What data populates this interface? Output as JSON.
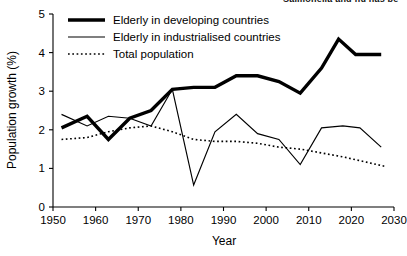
{
  "clipped_header": "Salmonella and flu has be",
  "chart_data": {
    "type": "line",
    "title": "",
    "xlabel": "Year",
    "ylabel": "Population growth (%)",
    "xlim": [
      1950,
      2030
    ],
    "ylim": [
      0,
      5
    ],
    "xticks": [
      1950,
      1960,
      1970,
      1980,
      1990,
      2000,
      2010,
      2020,
      2030
    ],
    "yticks": [
      0,
      1,
      2,
      3,
      4,
      5
    ],
    "grid": false,
    "legend_position": "top-left",
    "series": [
      {
        "name": "Elderly in developing countries",
        "style": "thick-solid",
        "color": "#000000",
        "x": [
          1952,
          1958,
          1963,
          1968,
          1973,
          1978,
          1983,
          1988,
          1993,
          1998,
          2003,
          2008,
          2013,
          2017,
          2021,
          2027
        ],
        "values": [
          2.05,
          2.35,
          1.75,
          2.3,
          2.5,
          3.05,
          3.1,
          3.1,
          3.4,
          3.4,
          3.25,
          2.95,
          3.6,
          4.35,
          3.95,
          3.95
        ]
      },
      {
        "name": "Elderly in industrialised countries",
        "style": "thin-solid",
        "color": "#000000",
        "x": [
          1952,
          1958,
          1963,
          1968,
          1973,
          1978,
          1983,
          1988,
          1993,
          1998,
          2003,
          2008,
          2013,
          2018,
          2022,
          2027
        ],
        "values": [
          2.4,
          2.1,
          2.35,
          2.3,
          2.1,
          3.05,
          0.57,
          1.95,
          2.4,
          1.9,
          1.75,
          1.1,
          2.05,
          2.1,
          2.05,
          1.55
        ]
      },
      {
        "name": "Total population",
        "style": "dotted",
        "color": "#000000",
        "x": [
          1952,
          1958,
          1963,
          1968,
          1973,
          1978,
          1983,
          1988,
          1993,
          1998,
          2003,
          2008,
          2013,
          2018,
          2022,
          2028
        ],
        "values": [
          1.75,
          1.8,
          1.95,
          2.05,
          2.1,
          1.95,
          1.75,
          1.7,
          1.7,
          1.65,
          1.55,
          1.5,
          1.4,
          1.3,
          1.2,
          1.05
        ]
      }
    ],
    "legend": [
      "Elderly in developing countries",
      "Elderly in industrialised countries",
      "Total population"
    ]
  }
}
